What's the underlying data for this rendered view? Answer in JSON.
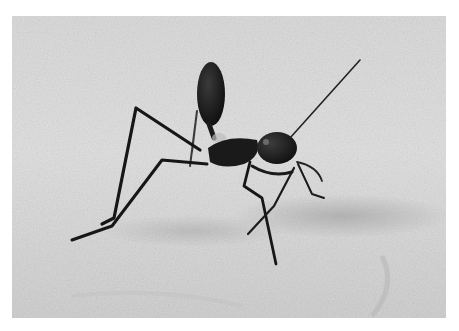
{
  "image": {
    "description": "Grayscale macro photograph of a long-legged ant standing on fine sand with its gaster raised",
    "subject": "ant",
    "setting": "sand",
    "colors": {
      "page_background": "#ffffff",
      "sand_light": "#e4e4e4",
      "sand_mid": "#cfcfcf",
      "sand_shadow": "#a8a8a8",
      "ant_body": "#141414",
      "ant_highlight": "#5a5a5a"
    },
    "photo_bounds": {
      "x": 12,
      "y": 16,
      "width": 434,
      "height": 302
    }
  }
}
